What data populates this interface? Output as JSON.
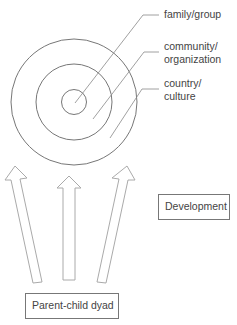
{
  "diagram": {
    "rings": [
      {
        "id": "inner",
        "label": "family/group"
      },
      {
        "id": "middle",
        "label_line1": "community/",
        "label_line2": "organization"
      },
      {
        "id": "outer",
        "label_line1": "country/",
        "label_line2": "culture"
      }
    ],
    "development_box": {
      "label": "Development"
    },
    "source_box": {
      "label": "Parent-child dyad"
    },
    "arrows": [
      {
        "id": "left",
        "direction": "up-left"
      },
      {
        "id": "center",
        "direction": "up"
      },
      {
        "id": "right",
        "direction": "up-right"
      }
    ],
    "colors": {
      "stroke": "#777777",
      "arrow_stroke": "#aaaaaa",
      "text": "#444444"
    }
  }
}
